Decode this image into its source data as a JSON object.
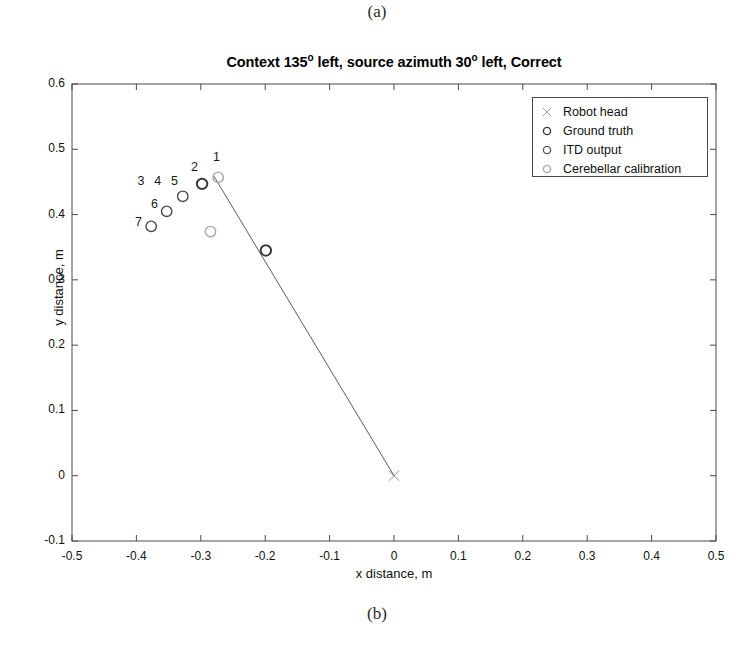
{
  "figure": {
    "caption_top": "(a)",
    "caption_bottom": "(b)"
  },
  "chart_data": {
    "type": "scatter",
    "title_parts": {
      "before_first_deg": "Context 135",
      "deg1": "o",
      "middle": " left, source azimuth 30",
      "deg2": "o",
      "after": " left, Correct"
    },
    "xlabel": "x distance, m",
    "ylabel": "y distance, m",
    "xlim": [
      -0.5,
      0.5
    ],
    "ylim": [
      -0.1,
      0.6
    ],
    "grid": false,
    "xticks": [
      "-0.5",
      "-0.4",
      "-0.3",
      "-0.2",
      "-0.1",
      "0",
      "0.1",
      "0.2",
      "0.3",
      "0.4",
      "0.5"
    ],
    "xtick_values": [
      -0.5,
      -0.4,
      -0.3,
      -0.2,
      -0.1,
      0,
      0.1,
      0.2,
      0.3,
      0.4,
      0.5
    ],
    "yticks": [
      "-0.1",
      "0",
      "0.1",
      "0.2",
      "0.3",
      "0.4",
      "0.5",
      "0.6"
    ],
    "ytick_values": [
      -0.1,
      0,
      0.1,
      0.2,
      0.3,
      0.4,
      0.5,
      0.6
    ],
    "legend_position": "upper right",
    "colors": {
      "ground_truth": "#3a3a3a",
      "itd_output": "#5a5a5a",
      "cerebellar": "#a8a8a8",
      "robot_head": "#8a8a8a",
      "axis": "#4a4a4a",
      "sightline": "#5c5c5c"
    },
    "legend": [
      {
        "label": "Robot head",
        "marker": "x",
        "color": "#9a9a9a"
      },
      {
        "label": "Ground truth",
        "marker": "o",
        "color": "#3a3a3a"
      },
      {
        "label": "ITD output",
        "marker": "o",
        "color": "#5a5a5a"
      },
      {
        "label": "Cerebellar calibration",
        "marker": "o",
        "color": "#a8a8a8"
      }
    ],
    "series": [
      {
        "name": "Robot head",
        "marker": "x",
        "color": "#8a8a8a",
        "points": [
          {
            "x": 0.0,
            "y": 0.0
          }
        ]
      },
      {
        "name": "Ground truth",
        "marker": "o",
        "color": "#3a3a3a",
        "points": [
          {
            "x": -0.199,
            "y": 0.345
          },
          {
            "x": -0.298,
            "y": 0.447
          }
        ]
      },
      {
        "name": "Cerebellar calibration",
        "marker": "o",
        "color": "#a8a8a8",
        "points": [
          {
            "x": -0.273,
            "y": 0.457
          },
          {
            "x": -0.285,
            "y": 0.374
          }
        ]
      },
      {
        "name": "ITD output",
        "marker": "o",
        "color": "#4a4a4a",
        "points": [
          {
            "x": -0.328,
            "y": 0.428
          },
          {
            "x": -0.353,
            "y": 0.405
          },
          {
            "x": -0.377,
            "y": 0.382
          }
        ]
      }
    ],
    "trial_labels": [
      {
        "text": "1",
        "x": -0.275,
        "y": 0.486
      },
      {
        "text": "2",
        "x": -0.309,
        "y": 0.472
      },
      {
        "text": "3",
        "x": -0.392,
        "y": 0.45
      },
      {
        "text": "4",
        "x": -0.366,
        "y": 0.45
      },
      {
        "text": "5",
        "x": -0.34,
        "y": 0.45
      },
      {
        "text": "6",
        "x": -0.371,
        "y": 0.415
      },
      {
        "text": "7",
        "x": -0.396,
        "y": 0.387
      }
    ],
    "sightline": {
      "x0": 0.0,
      "y0": 0.0,
      "x1": -0.281,
      "y1": 0.461
    },
    "annotations": []
  }
}
